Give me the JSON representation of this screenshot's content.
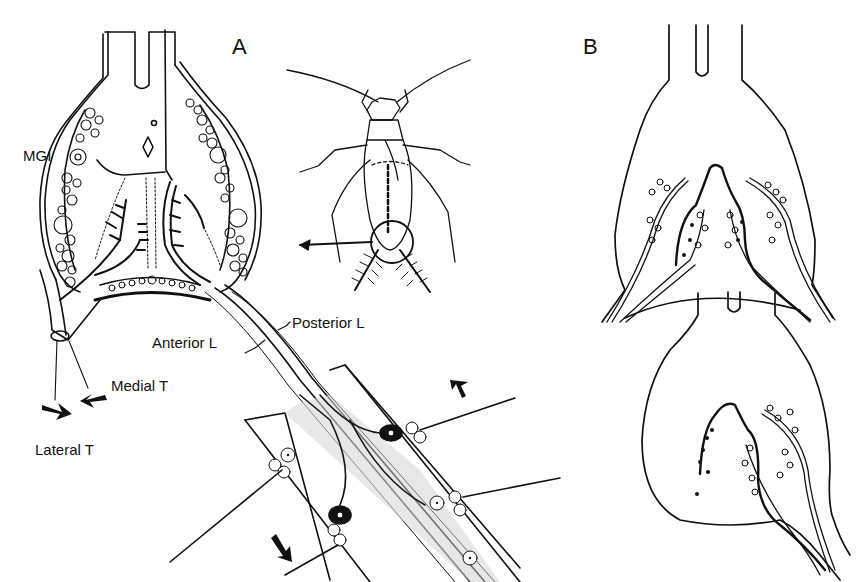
{
  "figure": {
    "panels": [
      {
        "id": "A",
        "label": "A"
      },
      {
        "id": "B",
        "label": "B"
      }
    ],
    "labels": {
      "mgi": "MGI",
      "posterior_l": "Posterior L",
      "anterior_l": "Anterior L",
      "medial_t": "Medial T",
      "lateral_t": "Lateral T"
    },
    "colors": {
      "ink": "#111111",
      "paper": "#ffffff",
      "stipple": "#bdbdbd"
    }
  }
}
